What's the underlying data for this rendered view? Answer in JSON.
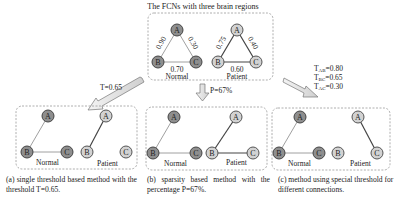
{
  "top": {
    "title": "The FCNs with three brain regions",
    "normal_label": "Normal",
    "patient_label": "Patient",
    "normal_weights": {
      "AB": "0.90",
      "AC": "0.30",
      "BC": "0.70"
    },
    "patient_weights": {
      "AB": "0.75",
      "AC": "0.40",
      "BC": "0.60"
    }
  },
  "nodes": {
    "a": "A",
    "b": "B",
    "c": "C"
  },
  "arrows": {
    "left": "T=0.65",
    "middle": "P=67%",
    "right_ab": "T",
    "right_ab_sub": "AB",
    "right_ab_val": "=0.80",
    "right_bc": "T",
    "right_bc_sub": "BC",
    "right_bc_val": "=0.65",
    "right_ac": "T",
    "right_ac_sub": "AC",
    "right_ac_val": "=0.30"
  },
  "panels": [
    {
      "normal_label": "Normal",
      "patient_label": "Patient"
    },
    {
      "normal_label": "Normal",
      "patient_label": "Patient"
    },
    {
      "normal_label": "Normal",
      "patient_label": "Patient"
    }
  ],
  "captions": {
    "a": "(a) single threshold based method with the threshold T=0.65.",
    "b": "(b) sparsity based method with the percentage P=67%.",
    "c": "(c) method using special threshold for different connections."
  },
  "colors": {
    "normal_node": "#8e8e8e",
    "patient_node": "#d2d2d2",
    "normal_edge": "#a0a0a0",
    "patient_edge": "#444444"
  }
}
